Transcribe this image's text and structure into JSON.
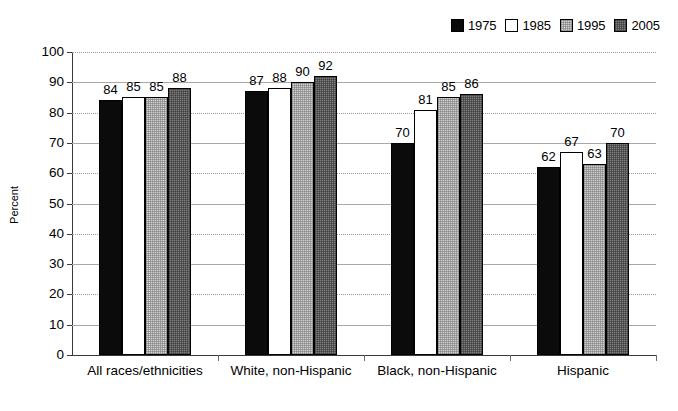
{
  "chart_data": {
    "type": "bar",
    "title": "",
    "subtitle": "",
    "xlabel": "",
    "ylabel": "Percent",
    "ylim": [
      0,
      100
    ],
    "ytick_step": 10,
    "yticks": [
      "100",
      "90",
      "80",
      "70",
      "60",
      "50",
      "40",
      "30",
      "20",
      "10",
      "0"
    ],
    "grid": true,
    "grid_axis": "y",
    "legend_position": "top-right",
    "categories": [
      "All races/ethnicities",
      "White, non-Hispanic",
      "Black, non-Hispanic",
      "Hispanic"
    ],
    "series": [
      {
        "name": "1975",
        "color": "#0b0b0b",
        "values": [
          84,
          87,
          70,
          62
        ]
      },
      {
        "name": "1985",
        "color": "#ffffff",
        "values": [
          85,
          88,
          81,
          67
        ]
      },
      {
        "name": "1995",
        "color": "#d2d2d2",
        "values": [
          85,
          90,
          85,
          63
        ]
      },
      {
        "name": "2005",
        "color": "#7d7d7d",
        "values": [
          88,
          92,
          86,
          70
        ]
      }
    ]
  },
  "legend": {
    "items": [
      {
        "label": "1975"
      },
      {
        "label": "1985"
      },
      {
        "label": "1995"
      },
      {
        "label": "2005"
      }
    ]
  },
  "axes": {
    "y_title": "Percent"
  }
}
